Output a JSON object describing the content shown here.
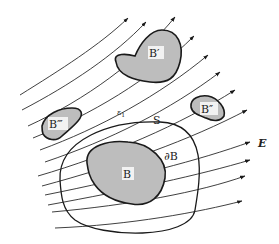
{
  "figure": {
    "labels": {
      "B_main": "B",
      "B_prime": "B′",
      "B_double_prime": "B″",
      "B_triple_prime": "B‴",
      "boundary": "∂B",
      "surface": "S",
      "epsilon": "ε",
      "epsilon_sub": "1",
      "field": "E"
    },
    "colors": {
      "region_fill": "#bdbdbd",
      "stroke": "#1a1a1a",
      "background": "#ffffff"
    }
  }
}
